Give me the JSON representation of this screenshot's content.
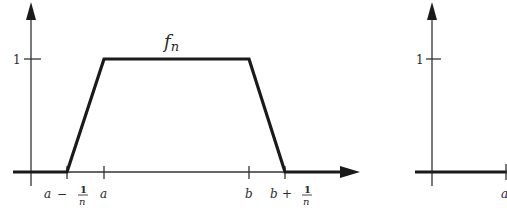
{
  "figure": {
    "left_plot": {
      "curve_label": "f",
      "curve_subscript": "n",
      "y_tick_label": "1",
      "x_tick_labels": {
        "a_minus": {
          "base": "a",
          "op": "−",
          "num": "1",
          "den": "n"
        },
        "a": "a",
        "b": "b",
        "b_plus": {
          "base": "b",
          "op": "+",
          "num": "1",
          "den": "n"
        }
      }
    },
    "right_plot": {
      "y_tick_label": "1",
      "x_tick_label": "a"
    },
    "colors": {
      "ink": "#1a1a1a",
      "background": "#ffffff"
    }
  }
}
